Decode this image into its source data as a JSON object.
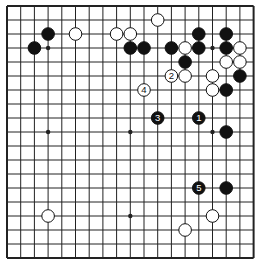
{
  "board": {
    "size": 19,
    "colors": {
      "background": "#ffffff",
      "line": "#222222",
      "black": "#111111",
      "white": "#ffffff",
      "label_on_black": "#ffffff",
      "label_on_white": "#111111"
    },
    "hoshi": [
      [
        3,
        3
      ],
      [
        9,
        3
      ],
      [
        15,
        3
      ],
      [
        3,
        9
      ],
      [
        9,
        9
      ],
      [
        15,
        9
      ],
      [
        3,
        15
      ],
      [
        9,
        15
      ],
      [
        15,
        15
      ]
    ],
    "stones": [
      {
        "color": "black",
        "col": 3,
        "row": 2
      },
      {
        "color": "black",
        "col": 2,
        "row": 3
      },
      {
        "color": "white",
        "col": 5,
        "row": 2
      },
      {
        "color": "white",
        "col": 8,
        "row": 2
      },
      {
        "color": "white",
        "col": 9,
        "row": 2
      },
      {
        "color": "white",
        "col": 11,
        "row": 1
      },
      {
        "color": "black",
        "col": 9,
        "row": 3
      },
      {
        "color": "black",
        "col": 10,
        "row": 3
      },
      {
        "color": "black",
        "col": 12,
        "row": 3
      },
      {
        "color": "black",
        "col": 14,
        "row": 2
      },
      {
        "color": "black",
        "col": 16,
        "row": 2
      },
      {
        "color": "white",
        "col": 13,
        "row": 3
      },
      {
        "color": "black",
        "col": 14,
        "row": 3
      },
      {
        "color": "black",
        "col": 16,
        "row": 3
      },
      {
        "color": "white",
        "col": 17,
        "row": 3
      },
      {
        "color": "black",
        "col": 13,
        "row": 4
      },
      {
        "color": "white",
        "col": 16,
        "row": 4
      },
      {
        "color": "white",
        "col": 17,
        "row": 4
      },
      {
        "color": "white",
        "col": 13,
        "row": 5
      },
      {
        "color": "white",
        "col": 15,
        "row": 5
      },
      {
        "color": "black",
        "col": 17,
        "row": 5
      },
      {
        "color": "white",
        "col": 15,
        "row": 6
      },
      {
        "color": "black",
        "col": 16,
        "row": 6
      },
      {
        "color": "black",
        "col": 16,
        "row": 9
      },
      {
        "color": "black",
        "col": 16,
        "row": 13
      },
      {
        "color": "white",
        "col": 3,
        "row": 15
      },
      {
        "color": "white",
        "col": 15,
        "row": 15
      },
      {
        "color": "white",
        "col": 13,
        "row": 16
      },
      {
        "color": "black",
        "col": 14,
        "row": 8,
        "label": "1"
      },
      {
        "color": "white",
        "col": 12,
        "row": 5,
        "label": "2"
      },
      {
        "color": "black",
        "col": 11,
        "row": 8,
        "label": "3"
      },
      {
        "color": "white",
        "col": 10,
        "row": 6,
        "label": "4"
      },
      {
        "color": "black",
        "col": 14,
        "row": 13,
        "label": "5"
      }
    ]
  }
}
